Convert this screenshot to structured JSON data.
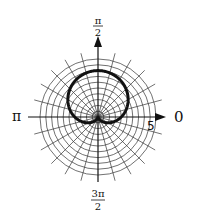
{
  "chart_data": {
    "type": "line",
    "coordinate_system": "polar",
    "title": "",
    "curve": {
      "name": "cardioid",
      "equation": "r = 2 + 2 sin(theta)",
      "a": 2,
      "b": 2,
      "color": "#111111"
    },
    "grid": true,
    "rings": {
      "count": 10,
      "step": 0.5,
      "max": 5
    },
    "spokes": {
      "count": 24,
      "step_degrees": 15
    },
    "radial_tick_label": {
      "text": "5",
      "value": 5
    },
    "angle_labels": {
      "right": {
        "text": "0"
      },
      "top": {
        "num": "π",
        "den": "2"
      },
      "left": {
        "text": "π"
      },
      "bottom": {
        "num": "3π",
        "den": "2"
      }
    },
    "axis_color": "#111111",
    "grid_color": "#333333"
  }
}
